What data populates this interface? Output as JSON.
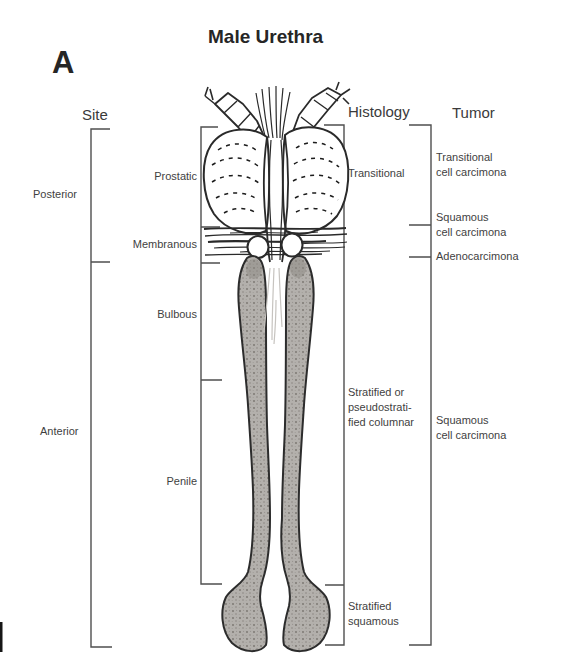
{
  "panel_label": "A",
  "title": "Male Urethra",
  "site": {
    "header": "Site",
    "regions": {
      "posterior": "Posterior",
      "anterior": "Anterior"
    },
    "segments": {
      "prostatic": "Prostatic",
      "membranous": "Membranous",
      "bulbous": "Bulbous",
      "penile": "Penile"
    }
  },
  "histology": {
    "header": "Histology",
    "prostatic": "Transitional",
    "bulbopenile": "Stratified or\npseudostrati-\nfied columnar",
    "distal": "Stratified\nsquamous"
  },
  "tumor": {
    "header": "Tumor",
    "prostatic": "Transitional\ncell carcimona",
    "membranous_upper": "Squamous\ncell carcimona",
    "membranous_lower": "Adenocarcimona",
    "anterior": "Squamous\ncell carcimona"
  },
  "illustration": {
    "name": "male-urethra-longitudinal-section"
  },
  "colors": {
    "background": "#ffffff",
    "ink": "#3f3f3f",
    "bracket_line": "#4f4f4f",
    "drawing_line": "#2a2a2a",
    "tissue_gray": "#b3b0ac"
  }
}
